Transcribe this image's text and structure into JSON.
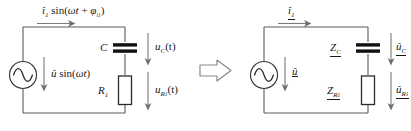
{
  "figure": {
    "background_color": "#ffffff",
    "wire_color": "#5a5a5a",
    "component_color": "#1a1a1a",
    "arrow_color": "#6e6e6e"
  },
  "left_circuit": {
    "name": "time-domain-circuit",
    "source": {
      "symbol": "ac-source",
      "label_amplitude": "û",
      "label_rest": " sin(",
      "label_omega": "ωt",
      "label_close": ")",
      "full_label": "û sin(ωt)"
    },
    "current_label": {
      "amplitude": "î",
      "sub": "1",
      "rest": " sin(",
      "omega": "ωt",
      "plus": " + ",
      "phi": "φ",
      "phi_sub": "i",
      "phi_subsub": "1",
      "close": ")",
      "full_label": "î₁ sin(ωt + φi₁)"
    },
    "capacitor": {
      "symbol": "capacitor",
      "name_label": "C",
      "voltage_label_main": "u",
      "voltage_label_sub": "C",
      "voltage_label_rest": "(t)",
      "voltage_full": "uC(t)"
    },
    "resistor": {
      "symbol": "resistor",
      "name_label_main": "R",
      "name_label_sub": "1",
      "name_full": "R1",
      "voltage_label_main": "u",
      "voltage_label_sub": "R",
      "voltage_label_subsub": "1",
      "voltage_label_rest": "(t)",
      "voltage_full": "uR₁(t)"
    }
  },
  "transform_arrow": {
    "name": "implies-arrow",
    "direction": "right",
    "glyph": "⇒"
  },
  "right_circuit": {
    "name": "phasor-domain-circuit",
    "source": {
      "symbol": "ac-source",
      "label": "û",
      "underlined": true
    },
    "current_label": {
      "main": "î",
      "sub": "1",
      "full_label": "î₁",
      "underlined": true
    },
    "capacitor": {
      "symbol": "capacitor",
      "impedance_main": "Z",
      "impedance_sub": "C",
      "impedance_full": "ZC",
      "voltage_main": "û",
      "voltage_sub": "C",
      "voltage_full": "ûC"
    },
    "resistor": {
      "symbol": "resistor",
      "impedance_main": "Z",
      "impedance_sub": "R",
      "impedance_subsub": "1",
      "impedance_full": "ZR₁",
      "voltage_main": "û",
      "voltage_sub": "R",
      "voltage_subsub": "1",
      "voltage_full": "ûR₁"
    }
  }
}
